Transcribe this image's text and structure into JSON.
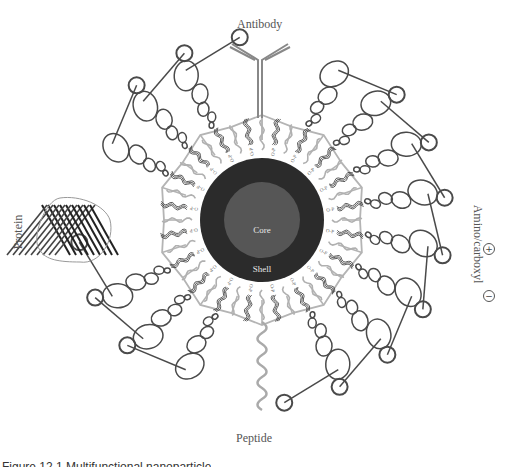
{
  "figure": {
    "labels": {
      "antibody": "Antibody",
      "peptide": "Peptide",
      "protein": "Protein",
      "amino_carboxyl": "Amino/carboxyl",
      "core": "Core",
      "shell": "Shell",
      "plus": "+",
      "minus": "−"
    },
    "caption_clipped": "Figure 12.1 Multifunctional nanoparticle",
    "linker_text": "O-P",
    "geometry": {
      "center": [
        262,
        220
      ],
      "core_radius": 38,
      "shell_radius": 62,
      "web_radius": 102,
      "ligand_count": 20,
      "polymer_count": 20
    },
    "colors": {
      "shell": "#2b2b2b",
      "core": "#565656",
      "web": "#b4b4b4",
      "grey_ligand": "#b0b0b0",
      "dark_ligand": "#333333",
      "polymer": "#4a4a4a",
      "text": "#555555"
    },
    "attachments": {
      "antibody_angle_deg": -90,
      "peptide_angle_deg": 90,
      "protein_angle_deg": 180,
      "amino_angle_deg": 0
    }
  }
}
